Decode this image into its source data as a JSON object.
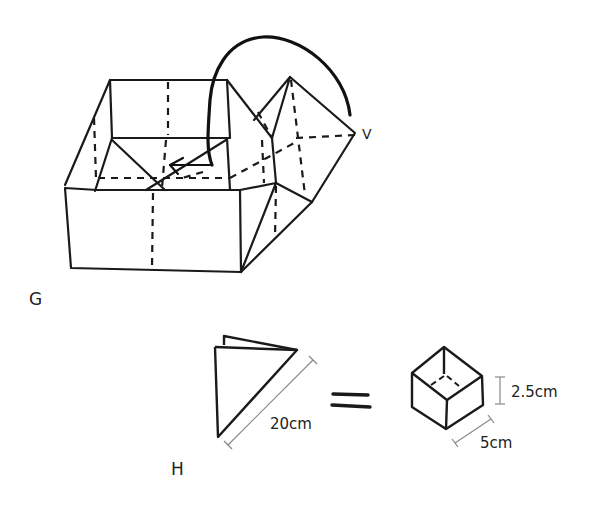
{
  "diagram": {
    "type": "origami-instructions",
    "colors": {
      "ink": "#1a1a1a",
      "dimension_line": "#888888",
      "background": "#ffffff"
    },
    "steps": [
      {
        "label": "G",
        "description": "Open box with one corner flap folded; curved arrow shows tucking the flap inside",
        "point_label": "V"
      },
      {
        "label": "H",
        "description": "Folded triangle equals finished box",
        "triangle_dimension": "20cm",
        "equals_sign": "=",
        "box_height": "2.5cm",
        "box_width": "5cm"
      }
    ]
  }
}
